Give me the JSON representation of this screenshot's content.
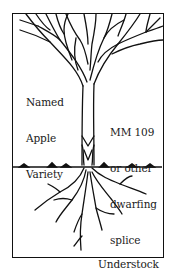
{
  "diagram": {
    "type": "grafted apple tree illustration",
    "labels": {
      "variety": [
        "Named",
        "Apple",
        "Variety"
      ],
      "splice": [
        "MM 109",
        "or other",
        "dwarfing",
        "splice"
      ],
      "understock": "Understock"
    },
    "colors": {
      "ink": "#111111",
      "background": "#ffffff"
    }
  }
}
